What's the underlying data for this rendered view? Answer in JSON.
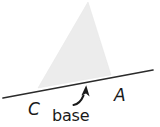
{
  "figure": {
    "name": "triangle-on-inclined-line",
    "background_color": "#ffffff",
    "line_color": "#2b2b2b",
    "triangle_fill": "#ececec",
    "text_color": "#1a1a1a"
  },
  "labels": {
    "vertex_c": "C",
    "vertex_a": "A",
    "base_annotation": "base"
  },
  "geometry": {
    "transversal_line": {
      "x1": 3,
      "y1": 98,
      "x2": 153,
      "y2": 70
    },
    "triangle": {
      "apex_x": 88,
      "apex_y": 2,
      "left_x": 38,
      "left_y": 88,
      "right_x": 111,
      "right_y": 75
    },
    "arrow": {
      "tip_x": 86,
      "tip_y": 85,
      "tail_x": 73,
      "tail_y": 104
    }
  },
  "icons": {
    "curved_arrow": "curved-arrow-icon"
  }
}
